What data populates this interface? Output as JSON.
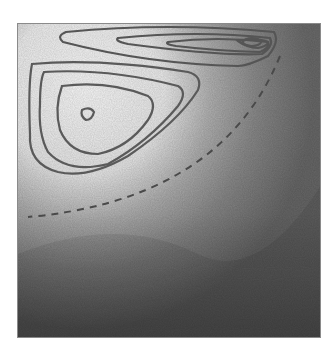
{
  "figure": {
    "colors": {
      "light": "#f4f4f4",
      "mid": "#9a9a9a",
      "dark": "#545454",
      "contour": "#5a5a5a",
      "frame": "#8a8a8a"
    },
    "contours": {
      "left_vortex_closed_levels": 4,
      "upper_elongated_levels": 4,
      "dashed_separatrix": true
    }
  }
}
